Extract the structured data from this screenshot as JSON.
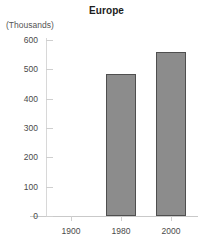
{
  "chart_data": {
    "type": "bar",
    "title": "Europe",
    "unit_label": "(Thousands)",
    "categories": [
      "1900",
      "1980",
      "2000"
    ],
    "values": [
      0,
      483,
      560
    ],
    "xlabel": "",
    "ylabel": "",
    "ylim": [
      0,
      600
    ],
    "yticks": [
      0,
      100,
      200,
      300,
      400,
      500,
      600
    ],
    "ytick_labels": [
      "0",
      "100",
      "200",
      "300",
      "400",
      "500",
      "600"
    ],
    "grid": false,
    "legend": false,
    "bar_fill_color": "#8c8c8c",
    "bar_border_color": "#4f4f4f",
    "axis_color": "#cfcfcf",
    "text_color": "#4a4a4a",
    "title_color": "#1c1c1c"
  }
}
